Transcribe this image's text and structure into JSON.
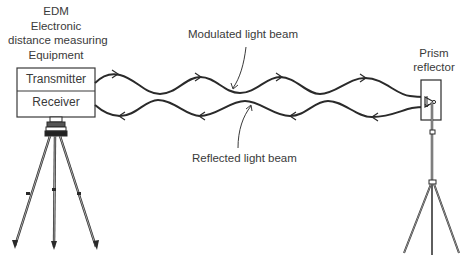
{
  "diagram": {
    "edm": {
      "title_lines": [
        "EDM",
        "Electronic",
        "distance measuring",
        "Equipment"
      ],
      "transmitter_label": "Transmitter",
      "receiver_label": "Receiver"
    },
    "beams": {
      "modulated_label": "Modulated light beam",
      "reflected_label": "Reflected light beam"
    },
    "prism": {
      "label_lines": [
        "Prism",
        "reflector"
      ]
    },
    "colors": {
      "line": "#2a2a2a",
      "text": "#3a3a3a",
      "background": "#ffffff"
    }
  }
}
